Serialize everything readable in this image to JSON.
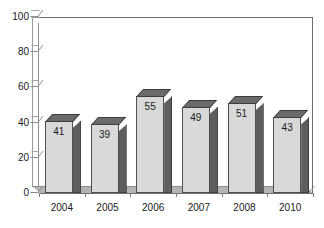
{
  "chart_data": {
    "type": "bar",
    "title": "",
    "subtitle": "",
    "xlabel": "",
    "ylabel": "",
    "categories": [
      "2004",
      "2005",
      "2006",
      "2007",
      "2008",
      "2010"
    ],
    "values": [
      41,
      39,
      55,
      49,
      51,
      43
    ],
    "series": [
      {
        "name": "",
        "values": [
          41,
          39,
          55,
          49,
          51,
          43
        ]
      }
    ],
    "data_labels": [
      "41",
      "39",
      "55",
      "49",
      "51",
      "43"
    ],
    "ylim": [
      0,
      100
    ],
    "ytick_values": [
      0,
      20,
      40,
      60,
      80,
      100
    ],
    "ytick_labels": [
      "0",
      "20",
      "40",
      "60",
      "80",
      "100"
    ],
    "ytick_step": 20,
    "grid": true,
    "grid_axis": "y",
    "legend": false,
    "legend_position": "none",
    "style": "3d-column",
    "colors": {
      "bar_front": "#d9d9d9",
      "bar_side": "#5e5e5e",
      "bar_top": "#6a6a6a",
      "bar_outline": "#4f4f4f",
      "gridline": "#9b9b9b",
      "axis": "#6f6f6f",
      "floor": "#b4b4b4",
      "text": "#1a1a1a",
      "background": "#ffffff"
    }
  }
}
